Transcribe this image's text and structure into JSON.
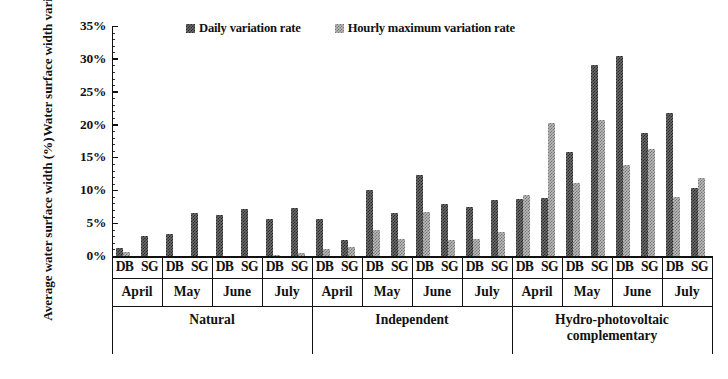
{
  "chart": {
    "type": "bar",
    "ylabel_line1": "Water surface width variation /",
    "ylabel_line2": "Average water surface width (%)",
    "yticks": [
      "0%",
      "5%",
      "10%",
      "15%",
      "20%",
      "25%",
      "30%",
      "35%"
    ],
    "ylim": [
      0,
      35
    ],
    "legend": [
      {
        "label": "Daily variation rate",
        "swatch": "dark-checkered-swatch",
        "color": "#6b6b6b"
      },
      {
        "label": "Hourly maximum variation rate",
        "swatch": "light-checkered-swatch",
        "color": "#b9b9b9"
      }
    ],
    "sublabels": [
      "DB",
      "SG"
    ],
    "months": [
      "April",
      "May",
      "June",
      "July"
    ],
    "scenarios": [
      "Natural",
      "Independent",
      "Hydro-photovoltaic complementary"
    ]
  },
  "chart_data": {
    "type": "bar",
    "title": "",
    "xlabel": "",
    "ylabel": "Water surface width variation / Average water surface width (%)",
    "ylim": [
      0,
      35
    ],
    "ytick_labels": [
      "0%",
      "5%",
      "10%",
      "15%",
      "20%",
      "25%",
      "30%",
      "35%"
    ],
    "grid": false,
    "legend_position": "top-center",
    "categories": [
      "Natural-April-DB",
      "Natural-April-SG",
      "Natural-May-DB",
      "Natural-May-SG",
      "Natural-June-DB",
      "Natural-June-SG",
      "Natural-July-DB",
      "Natural-July-SG",
      "Independent-April-DB",
      "Independent-April-SG",
      "Independent-May-DB",
      "Independent-May-SG",
      "Independent-June-DB",
      "Independent-June-SG",
      "Independent-July-DB",
      "Independent-July-SG",
      "Hydro-photovoltaic complementary-April-DB",
      "Hydro-photovoltaic complementary-April-SG",
      "Hydro-photovoltaic complementary-May-DB",
      "Hydro-photovoltaic complementary-May-SG",
      "Hydro-photovoltaic complementary-June-DB",
      "Hydro-photovoltaic complementary-June-SG",
      "Hydro-photovoltaic complementary-July-DB",
      "Hydro-photovoltaic complementary-July-SG"
    ],
    "series": [
      {
        "name": "Daily variation rate",
        "color": "#6b6b6b",
        "values": [
          1.2,
          3.1,
          3.4,
          6.6,
          6.2,
          7.1,
          5.6,
          7.3,
          5.6,
          2.4,
          10.0,
          6.6,
          12.4,
          7.9,
          7.4,
          8.6,
          8.7,
          8.9,
          15.8,
          29.0,
          30.4,
          18.7,
          21.7,
          10.3
        ]
      },
      {
        "name": "Hourly maximum variation rate",
        "color": "#b9b9b9",
        "values": [
          0.6,
          0.0,
          0.0,
          0.0,
          0.0,
          0.0,
          0.2,
          0.4,
          1.0,
          1.4,
          4.0,
          2.6,
          6.7,
          2.5,
          2.6,
          3.7,
          9.3,
          20.3,
          11.1,
          20.7,
          13.8,
          16.3,
          9.0,
          11.9
        ]
      }
    ],
    "group_structure": {
      "scenarios": [
        "Natural",
        "Independent",
        "Hydro-photovoltaic complementary"
      ],
      "months_per_scenario": [
        "April",
        "May",
        "June",
        "July"
      ],
      "sites_per_month": [
        "DB",
        "SG"
      ]
    }
  }
}
